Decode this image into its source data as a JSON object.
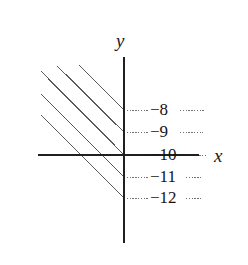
{
  "figure": {
    "kind": "coordinate-plane-with-parallel-lines",
    "background_color": "#ffffff",
    "axis_color": "#1f1f1f",
    "line_color": "#5a5a5a",
    "dash_color": "#707070",
    "text_color": "#141414",
    "axes": {
      "x_axis_label": "x",
      "y_axis_label": "y",
      "x_axis_y_pixel": 155,
      "y_axis_x_pixel": 124,
      "x_axis_start_x": 38,
      "x_axis_end_x": 199,
      "y_axis_start_y": 57,
      "y_axis_end_y": 243
    },
    "y_ticks": [
      {
        "label": "−8",
        "value": -8,
        "y": 110
      },
      {
        "label": "−9",
        "value": -9,
        "y": 132
      },
      {
        "label": "−10",
        "value": -10,
        "y": 155
      },
      {
        "label": "−11",
        "value": -11,
        "y": 177
      },
      {
        "label": "−12",
        "value": -12,
        "y": 198
      }
    ],
    "gridlines_left": [
      {
        "for_tick": "−8",
        "x1": 124,
        "x2": 148,
        "y": 110
      },
      {
        "for_tick": "−9",
        "x1": 124,
        "x2": 148,
        "y": 132
      },
      {
        "for_tick": "−10",
        "x1": 124,
        "x2": 148,
        "y": 155
      },
      {
        "for_tick": "−11",
        "x1": 124,
        "x2": 148,
        "y": 177
      },
      {
        "for_tick": "−12",
        "x1": 124,
        "x2": 148,
        "y": 198
      }
    ],
    "gridlines_right": [
      {
        "for_tick": "−8",
        "x1": 180,
        "x2": 205,
        "y": 110
      },
      {
        "for_tick": "−9",
        "x1": 180,
        "x2": 203,
        "y": 132
      },
      {
        "for_tick": "−10",
        "x1": 188,
        "x2": 208,
        "y": 155
      },
      {
        "for_tick": "−11",
        "x1": 186,
        "x2": 201,
        "y": 177
      },
      {
        "for_tick": "−12",
        "x1": 186,
        "x2": 202,
        "y": 198
      }
    ],
    "diagonal_lines": [
      {
        "id": "line-1",
        "slope": -1,
        "x1": 79,
        "y1": 65,
        "x2": 124,
        "y2": 110
      },
      {
        "id": "line-2",
        "slope": -1,
        "x1": 57,
        "y1": 66,
        "x2": 124,
        "y2": 132
      },
      {
        "id": "line-3",
        "slope": -1,
        "x1": 41,
        "y1": 71,
        "x2": 124,
        "y2": 155
      },
      {
        "id": "line-4",
        "slope": -1,
        "x1": 41,
        "y1": 94,
        "x2": 124,
        "y2": 177
      },
      {
        "id": "line-5",
        "slope": -1,
        "x1": 41,
        "y1": 115,
        "x2": 124,
        "y2": 198
      }
    ]
  }
}
